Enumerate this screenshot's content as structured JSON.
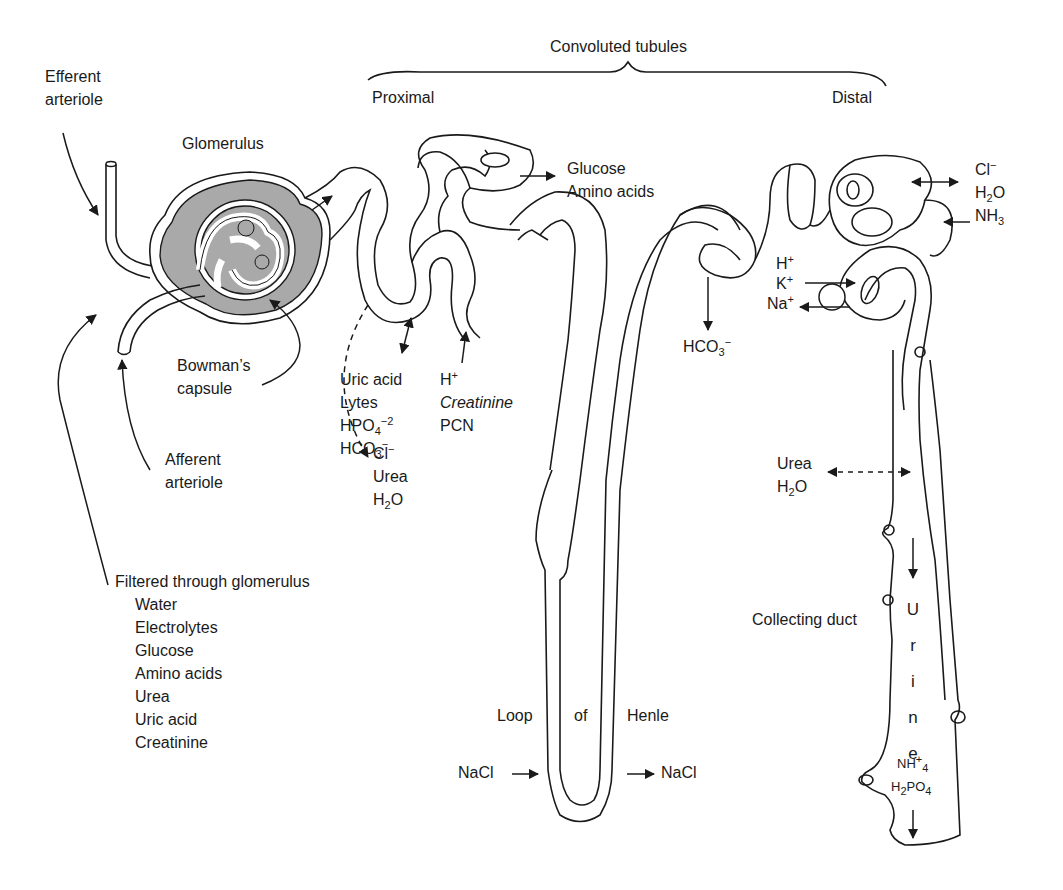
{
  "figure": {
    "header": {
      "convoluted_tubules": "Convoluted tubules",
      "proximal": "Proximal",
      "distal": "Distal"
    },
    "structures": {
      "efferent_arteriole": [
        "Efferent",
        "arteriole"
      ],
      "glomerulus": "Glomerulus",
      "bowmans_capsule": [
        "Bowman’s",
        "capsule"
      ],
      "afferent_arteriole": [
        "Afferent",
        "arteriole"
      ],
      "loop_of_henle": [
        "Loop",
        "of",
        "Henle"
      ],
      "collecting_duct": "Collecting duct"
    },
    "filtered": {
      "title": "Filtered through glomerulus",
      "items": [
        "Water",
        "Electrolytes",
        "Glucose",
        "Amino acids",
        "Urea",
        "Uric acid",
        "Creatinine"
      ]
    },
    "proximal_reabsorbed_top": [
      "Glucose",
      "Amino acids"
    ],
    "proximal_exchange": {
      "list": [
        "Uric acid",
        "Lytes",
        "HPO",
        "HCO"
      ],
      "hpo_sub": "4",
      "hpo_sup": "−2",
      "hco_sub": "3",
      "hco_sup": "−"
    },
    "proximal_secreted": {
      "h": "H",
      "h_sup": "+",
      "creatinine": "Creatinine",
      "pcn": "PCN"
    },
    "proximal_passive": {
      "cl": "Cl",
      "cl_sup": "−",
      "urea": "Urea",
      "h2o_h": "H",
      "h2o_sub": "2",
      "h2o_o": "O"
    },
    "loop_nacl": {
      "in": "NaCl",
      "out": "NaCl"
    },
    "distal_bicarb": {
      "text": "HCO",
      "sub": "3",
      "sup": "−"
    },
    "distal_exchange": {
      "cl": "Cl",
      "cl_sup": "−",
      "h2o_h": "H",
      "h2o_sub": "2",
      "h2o_o": "O",
      "nh3": "NH",
      "nh3_sub": "3"
    },
    "distal_pump": {
      "h": "H",
      "h_sup": "+",
      "k": "K",
      "k_sup": "+",
      "na": "Na",
      "na_sup": "+"
    },
    "collecting_passive": {
      "urea": "Urea",
      "h2o_h": "H",
      "h2o_sub": "2",
      "h2o_o": "O"
    },
    "urine_letters": [
      "U",
      "r",
      "i",
      "n",
      "e"
    ],
    "urine_solutes": {
      "nh4": "NH",
      "nh4_sub": "4",
      "nh4_sup": "+",
      "h2po4_h": "H",
      "h2po4_sub": "2",
      "h2po4_po": "PO",
      "h2po4_sub2": "4"
    },
    "colors": {
      "line": "#1a1a1a",
      "capsule_fill": "#a9a9a9",
      "background": "#ffffff"
    }
  }
}
